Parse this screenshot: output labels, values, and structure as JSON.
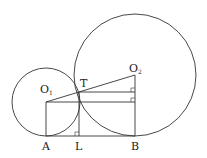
{
  "diagram": {
    "labels": {
      "O1": "O",
      "O1_sub": "1",
      "O2": "O",
      "O2_sub": "2",
      "T": "T",
      "A": "A",
      "L": "L",
      "B": "B"
    },
    "colors": {
      "stroke": "#333333",
      "background": "#ffffff"
    }
  }
}
